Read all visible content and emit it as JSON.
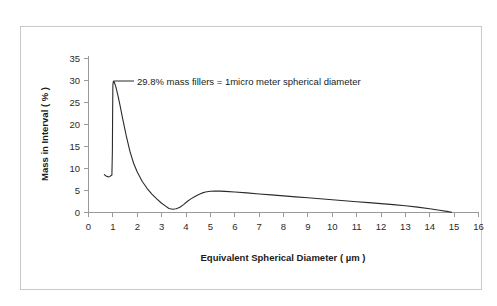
{
  "chart_data": {
    "type": "line",
    "title": "",
    "xlabel": "Equivalent Spherical Diameter ( µm )",
    "ylabel": "Mass in Interval ( % )",
    "xlim": [
      0,
      16
    ],
    "ylim": [
      0,
      35
    ],
    "xticks": [
      0,
      1,
      2,
      3,
      4,
      5,
      6,
      7,
      8,
      9,
      10,
      11,
      12,
      13,
      14,
      15,
      16
    ],
    "yticks": [
      0,
      5,
      10,
      15,
      20,
      25,
      30,
      35
    ],
    "xtick_labels": [
      "0",
      "1",
      "2",
      "3",
      "4",
      "5",
      "6",
      "7",
      "8",
      "9",
      "10",
      "11",
      "12",
      "13",
      "14",
      "15",
      "16"
    ],
    "ytick_labels": [
      "0",
      "5",
      "10",
      "15",
      "20",
      "25",
      "30",
      "35"
    ],
    "grid": false,
    "legend": null,
    "series": [
      {
        "name": "Mass in Interval",
        "color": "#2b2b2b",
        "x": [
          0.65,
          0.72,
          0.8,
          0.88,
          0.93,
          0.96,
          0.98,
          0.99,
          1.0,
          1.02,
          1.06,
          1.12,
          1.2,
          1.3,
          1.42,
          1.55,
          1.7,
          1.85,
          2.0,
          2.2,
          2.4,
          2.6,
          2.8,
          3.0,
          3.15,
          3.3,
          3.45,
          3.6,
          3.75,
          3.9,
          4.05,
          4.2,
          4.35,
          4.5,
          4.65,
          4.8,
          5.0,
          5.2,
          5.4,
          5.6,
          6.0,
          6.5,
          7.0,
          7.5,
          8.0,
          8.5,
          9.0,
          9.5,
          10.0,
          10.5,
          11.0,
          11.5,
          12.0,
          12.5,
          13.0,
          13.5,
          14.0,
          14.4,
          14.7,
          14.9
        ],
        "y": [
          8.6,
          8.3,
          8.1,
          8.2,
          8.4,
          8.5,
          14.0,
          23.0,
          29.0,
          29.8,
          29.6,
          28.6,
          26.8,
          24.2,
          20.8,
          17.4,
          13.9,
          11.2,
          9.2,
          7.1,
          5.5,
          4.2,
          3.1,
          2.1,
          1.5,
          0.9,
          0.75,
          0.85,
          1.2,
          1.8,
          2.5,
          3.1,
          3.6,
          4.05,
          4.4,
          4.65,
          4.82,
          4.87,
          4.85,
          4.8,
          4.65,
          4.45,
          4.22,
          4.0,
          3.78,
          3.56,
          3.34,
          3.12,
          2.9,
          2.68,
          2.46,
          2.24,
          2.02,
          1.78,
          1.52,
          1.22,
          0.85,
          0.52,
          0.25,
          0.05
        ]
      }
    ],
    "annotations": [
      {
        "text": "29.8% mass fillers = 1micro meter spherical diameter",
        "points_to_x": 1.0,
        "points_to_y": 29.8
      }
    ]
  },
  "figure": {
    "frame_color": "#c9c9cc",
    "background_color": "#ffffff",
    "axis_color": "#9a9a9a",
    "text_color": "#1b1b1b"
  }
}
